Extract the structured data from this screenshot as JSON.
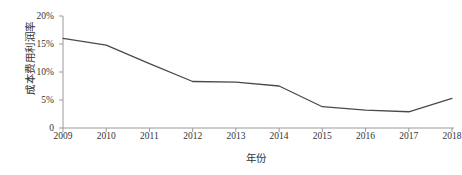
{
  "chart_data": {
    "type": "line",
    "title": "",
    "xlabel": "年份",
    "ylabel": "成本费用利润率",
    "categories": [
      "2009",
      "2010",
      "2011",
      "2012",
      "2013",
      "2014",
      "2015",
      "2016",
      "2017",
      "2018"
    ],
    "values": [
      16.0,
      14.8,
      11.5,
      8.3,
      8.2,
      7.5,
      3.8,
      3.2,
      2.9,
      5.3
    ],
    "series": [
      {
        "name": "成本费用利润率",
        "values": [
          16.0,
          14.8,
          11.5,
          8.3,
          8.2,
          7.5,
          3.8,
          3.2,
          2.9,
          5.3
        ]
      }
    ],
    "ylim": [
      0,
      20
    ],
    "yticks": [
      0,
      5,
      10,
      15,
      20
    ],
    "ytick_labels": [
      "0",
      "5%",
      "10%",
      "15%",
      "20%"
    ],
    "grid": false,
    "legend": false,
    "line_color": "#4a4a4a"
  },
  "axis": {
    "y_title": "成本费用利润率",
    "x_title": "年份"
  }
}
